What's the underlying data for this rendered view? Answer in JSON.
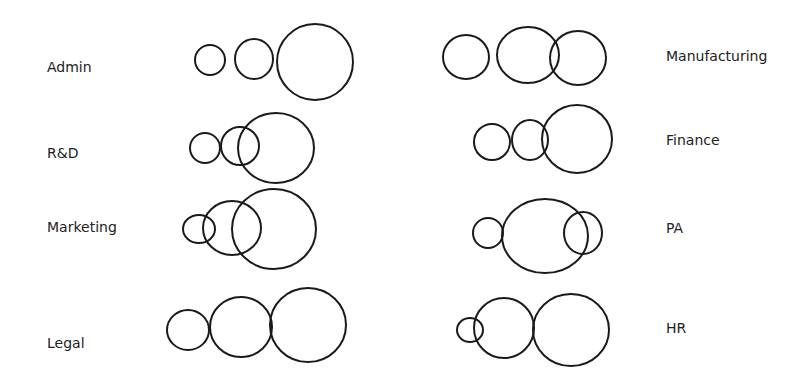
{
  "diagram": {
    "type": "overlapping-circles",
    "stroke_color": "#1a1a1a",
    "background": "#ffffff",
    "departments": [
      {
        "name": "Admin",
        "label_x": 47,
        "label_y": 72,
        "circles": [
          {
            "cx": 210,
            "cy": 60,
            "rx": 15,
            "ry": 15
          },
          {
            "cx": 254,
            "cy": 59,
            "rx": 19,
            "ry": 20
          },
          {
            "cx": 315,
            "cy": 62,
            "rx": 38,
            "ry": 38
          }
        ]
      },
      {
        "name": "R&D",
        "label_x": 47,
        "label_y": 158,
        "circles": [
          {
            "cx": 205,
            "cy": 148,
            "rx": 15,
            "ry": 15
          },
          {
            "cx": 240,
            "cy": 146,
            "rx": 19,
            "ry": 19
          },
          {
            "cx": 276,
            "cy": 148,
            "rx": 38,
            "ry": 35
          }
        ]
      },
      {
        "name": "Marketing",
        "label_x": 47,
        "label_y": 232,
        "circles": [
          {
            "cx": 199,
            "cy": 229,
            "rx": 16,
            "ry": 14
          },
          {
            "cx": 232,
            "cy": 228,
            "rx": 29,
            "ry": 27
          },
          {
            "cx": 274,
            "cy": 229,
            "rx": 42,
            "ry": 40
          }
        ]
      },
      {
        "name": "Legal",
        "label_x": 47,
        "label_y": 348,
        "circles": [
          {
            "cx": 188,
            "cy": 330,
            "rx": 21,
            "ry": 20
          },
          {
            "cx": 241,
            "cy": 327,
            "rx": 31,
            "ry": 30
          },
          {
            "cx": 308,
            "cy": 325,
            "rx": 38,
            "ry": 37
          }
        ]
      },
      {
        "name": "Manufacturing",
        "label_x": 666,
        "label_y": 61,
        "circles": [
          {
            "cx": 466,
            "cy": 57,
            "rx": 23,
            "ry": 22
          },
          {
            "cx": 528,
            "cy": 55,
            "rx": 31,
            "ry": 28
          },
          {
            "cx": 578,
            "cy": 58,
            "rx": 28,
            "ry": 27
          }
        ]
      },
      {
        "name": "Finance",
        "label_x": 666,
        "label_y": 145,
        "circles": [
          {
            "cx": 492,
            "cy": 142,
            "rx": 18,
            "ry": 18
          },
          {
            "cx": 530,
            "cy": 140,
            "rx": 18,
            "ry": 20
          },
          {
            "cx": 577,
            "cy": 139,
            "rx": 35,
            "ry": 34
          }
        ]
      },
      {
        "name": "PA",
        "label_x": 666,
        "label_y": 233,
        "circles": [
          {
            "cx": 488,
            "cy": 233,
            "rx": 15,
            "ry": 15
          },
          {
            "cx": 545,
            "cy": 236,
            "rx": 43,
            "ry": 37
          },
          {
            "cx": 583,
            "cy": 233,
            "rx": 19,
            "ry": 21
          }
        ]
      },
      {
        "name": "HR",
        "label_x": 666,
        "label_y": 333,
        "circles": [
          {
            "cx": 470,
            "cy": 330,
            "rx": 13,
            "ry": 12
          },
          {
            "cx": 504,
            "cy": 328,
            "rx": 30,
            "ry": 30
          },
          {
            "cx": 571,
            "cy": 330,
            "rx": 38,
            "ry": 36
          }
        ]
      }
    ]
  }
}
